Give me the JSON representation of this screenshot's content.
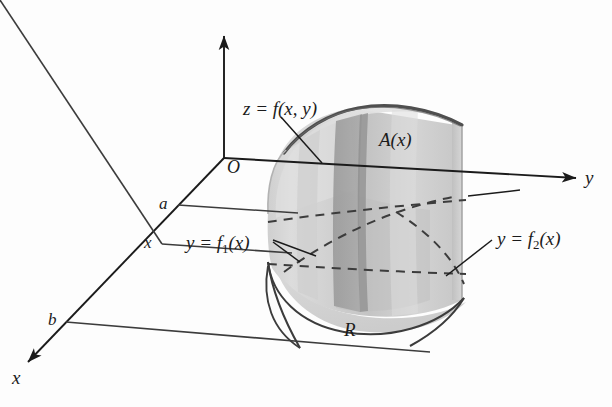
{
  "figure": {
    "type": "3d-solid-diagram",
    "background_color": "#fdfdfd",
    "ink_color": "#1b1b1b",
    "axes": {
      "z_axis": {
        "name": "z-axis",
        "label": "",
        "arrow": true
      },
      "y_axis": {
        "name": "y-axis",
        "label": "y",
        "arrow": true
      },
      "x_axis": {
        "name": "x-axis",
        "label": "x",
        "arrow": true
      },
      "origin_label": "O"
    },
    "labels": {
      "surface": "z = f(x, y)",
      "cross_section_area": "A(x)",
      "lower_boundary_curve": "y = f",
      "lower_boundary_sub": "1",
      "lower_boundary_tail": "(x)",
      "upper_boundary_curve": "y = f",
      "upper_boundary_sub": "2",
      "upper_boundary_tail": "(x)",
      "region": "R",
      "x_point_a": "a",
      "x_point_x": "x",
      "x_point_b": "b"
    },
    "shading": {
      "surface_light": "#dedede",
      "surface_mid": "#c9c9c9",
      "slab_front": "#b4b4b4",
      "slab_dark": "#9a9a9a",
      "base_light": "#d8d8d8",
      "rim_dark": "#5a5a5a"
    }
  }
}
